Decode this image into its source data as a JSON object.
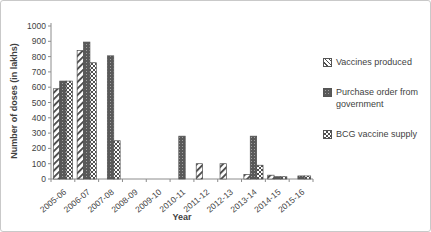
{
  "figure": {
    "background": "#ffffff",
    "border_color": "#c9c9c9"
  },
  "chart_data": {
    "type": "bar",
    "title": "",
    "xlabel": "Year",
    "ylabel": "Number of doses (in lakhs)",
    "ylim": [
      0,
      1000
    ],
    "yticks": [
      0,
      100,
      200,
      300,
      400,
      500,
      600,
      700,
      800,
      900,
      1000
    ],
    "grid": false,
    "legend_position": "right",
    "categories": [
      "2005-06",
      "2006-07",
      "2007-08",
      "2008-09",
      "2009-10",
      "2010-11",
      "2011-12",
      "2012-13",
      "2013-14",
      "2014-15",
      "2015-16"
    ],
    "series": [
      {
        "name": "Vaccines produced",
        "pattern": "diagonal-hatch",
        "values": [
          590,
          840,
          0,
          0,
          0,
          0,
          100,
          100,
          30,
          25,
          0
        ]
      },
      {
        "name": "Purchase order from government",
        "pattern": "dark-dotted",
        "values": [
          640,
          895,
          805,
          0,
          0,
          280,
          0,
          0,
          280,
          15,
          20
        ]
      },
      {
        "name": "BCG vaccine supply",
        "pattern": "checkerboard",
        "values": [
          640,
          760,
          250,
          0,
          0,
          0,
          0,
          0,
          90,
          15,
          20
        ]
      }
    ],
    "colors": {
      "bar_dark": "#595959",
      "bar_outline": "#4f4f4f",
      "axis": "#8c8c8c",
      "text": "#3f3f3f"
    }
  }
}
